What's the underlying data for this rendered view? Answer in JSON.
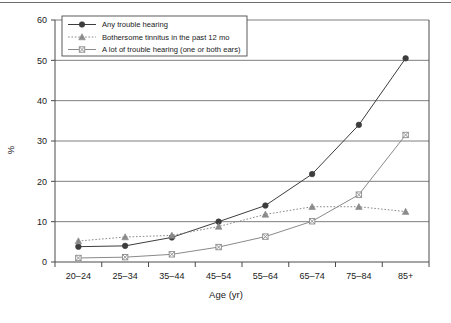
{
  "chart_data": {
    "type": "line",
    "title": "",
    "xlabel": "Age (yr)",
    "ylabel": "%",
    "categories": [
      "20–24",
      "25–34",
      "35–44",
      "45–54",
      "55–64",
      "65–74",
      "75–84",
      "85+"
    ],
    "yticks": [
      0,
      10,
      20,
      30,
      40,
      50,
      60
    ],
    "ylim": [
      0,
      60
    ],
    "grid": "horizontal",
    "legend_position": "top-left",
    "series": [
      {
        "name": "Any trouble hearing",
        "marker": "filled-circle",
        "line_style": "solid",
        "color": "#3d3d3d",
        "values": [
          3.8,
          4.0,
          6.1,
          10.0,
          14.0,
          21.8,
          34.0,
          50.5
        ]
      },
      {
        "name": "Bothersome tinnitus in the past 12 mo",
        "marker": "filled-triangle",
        "line_style": "dotted",
        "color": "#8a8a8a",
        "values": [
          5.2,
          6.2,
          6.6,
          8.8,
          11.8,
          13.7,
          13.7,
          12.5
        ]
      },
      {
        "name": "A lot of trouble hearing (one or both ears)",
        "marker": "x-square",
        "line_style": "solid",
        "color": "#8a8a8a",
        "values": [
          1.0,
          1.2,
          1.9,
          3.7,
          6.3,
          10.1,
          16.7,
          31.5
        ]
      }
    ]
  },
  "legend": {
    "items": [
      {
        "label": "Any trouble hearing"
      },
      {
        "label": "Bothersome tinnitus in the past 12 mo"
      },
      {
        "label": "A lot of trouble hearing (one or both ears)"
      }
    ]
  },
  "colors": {
    "axis": "#4a4a4a",
    "grid": "#707070",
    "series_dark": "#3d3d3d",
    "series_gray": "#8a8a8a"
  }
}
